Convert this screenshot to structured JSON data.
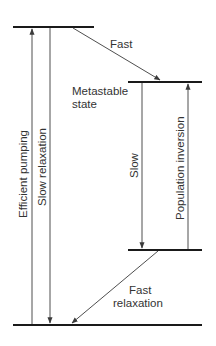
{
  "diagram": {
    "type": "energy-level-diagram",
    "colors": {
      "lines": "#1a1a1a",
      "arrows": "#3a3a3a",
      "text": "#333333",
      "background": "#ffffff"
    },
    "levels": [
      {
        "id": "pump-level",
        "label": ""
      },
      {
        "id": "metastable-level",
        "label_line1": "Metastable",
        "label_line2": "state"
      },
      {
        "id": "lower-laser-level",
        "label": ""
      },
      {
        "id": "ground-level",
        "label": ""
      }
    ],
    "transitions": {
      "efficient_pumping": "Efficient pumping",
      "slow_relaxation": "Slow relaxation",
      "fast": "Fast",
      "slow": "Slow",
      "population_inversion": "Population inversion",
      "fast_relaxation_line1": "Fast",
      "fast_relaxation_line2": "relaxation"
    }
  }
}
